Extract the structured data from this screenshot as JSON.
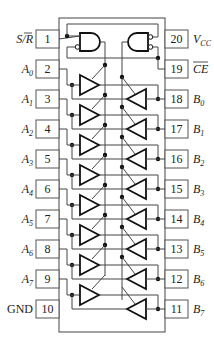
{
  "diagram": {
    "type": "ic-pinout",
    "colors": {
      "line": "#444444",
      "symbol": "#111111",
      "background": "#ffffff"
    },
    "left_pins": [
      {
        "num": "1",
        "label": "S/R̅",
        "label_main": "S/",
        "label_bar": "R",
        "bar": true
      },
      {
        "num": "2",
        "label": "A0",
        "label_main": "A",
        "label_sub": "0"
      },
      {
        "num": "3",
        "label": "A1",
        "label_main": "A",
        "label_sub": "1"
      },
      {
        "num": "4",
        "label": "A2",
        "label_main": "A",
        "label_sub": "2"
      },
      {
        "num": "5",
        "label": "A3",
        "label_main": "A",
        "label_sub": "3"
      },
      {
        "num": "6",
        "label": "A4",
        "label_main": "A",
        "label_sub": "4"
      },
      {
        "num": "7",
        "label": "A5",
        "label_main": "A",
        "label_sub": "5"
      },
      {
        "num": "8",
        "label": "A6",
        "label_main": "A",
        "label_sub": "6"
      },
      {
        "num": "9",
        "label": "A7",
        "label_main": "A",
        "label_sub": "7"
      },
      {
        "num": "10",
        "label": "GND",
        "label_main": "GND"
      }
    ],
    "right_pins": [
      {
        "num": "20",
        "label": "VCC",
        "label_main": "V",
        "label_sub": "CC"
      },
      {
        "num": "19",
        "label": "CE̅",
        "label_main": "CE",
        "bar": true
      },
      {
        "num": "18",
        "label": "B0",
        "label_main": "B",
        "label_sub": "0"
      },
      {
        "num": "17",
        "label": "B1",
        "label_main": "B",
        "label_sub": "1"
      },
      {
        "num": "16",
        "label": "B2",
        "label_main": "B",
        "label_sub": "2"
      },
      {
        "num": "15",
        "label": "B3",
        "label_main": "B",
        "label_sub": "3"
      },
      {
        "num": "14",
        "label": "B4",
        "label_main": "B",
        "label_sub": "4"
      },
      {
        "num": "13",
        "label": "B5",
        "label_main": "B",
        "label_sub": "5"
      },
      {
        "num": "12",
        "label": "B6",
        "label_main": "B",
        "label_sub": "6"
      },
      {
        "num": "11",
        "label": "B7",
        "label_main": "B",
        "label_sub": "7"
      }
    ],
    "gates": [
      {
        "name": "left-and-gate",
        "type": "AND",
        "inputs": [
          "S/R",
          "CE (inverted)"
        ],
        "drives": "A-to-B buffers"
      },
      {
        "name": "right-and-gate",
        "type": "AND",
        "inputs": [
          "S/R (inverted)",
          "CE (inverted)"
        ],
        "drives": "B-to-A buffers"
      }
    ],
    "buffer_pairs": 8
  }
}
